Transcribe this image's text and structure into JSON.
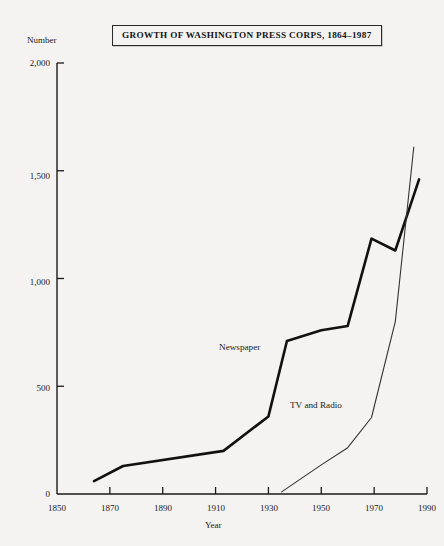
{
  "title": {
    "text": "GROWTH OF WASHINGTON PRESS CORPS, 1864–1987"
  },
  "axes": {
    "y_caption": "Number",
    "x_caption": "Year",
    "y_ticks": [
      "2,000",
      "1,500",
      "1,000",
      "500",
      "0"
    ],
    "x_ticks": [
      "1850",
      "1870",
      "1890",
      "1910",
      "1930",
      "1950",
      "1970",
      "1990"
    ]
  },
  "labels": {
    "newspaper": "Newspaper",
    "tv_and_radio": "TV and Radio"
  },
  "colors": {
    "background": "#f4f3f1",
    "ink": "#1a1a1a",
    "newspaper_line": "#111111",
    "tvradio_line": "#333333"
  },
  "chart_data": {
    "type": "line",
    "title": "GROWTH OF WASHINGTON PRESS CORPS, 1864–1987",
    "xlabel": "Year",
    "ylabel": "Number",
    "xlim": [
      1850,
      1990
    ],
    "ylim": [
      0,
      2000
    ],
    "xticks": [
      1850,
      1870,
      1890,
      1910,
      1930,
      1950,
      1970,
      1990
    ],
    "yticks": [
      0,
      500,
      1000,
      1500,
      2000
    ],
    "grid": false,
    "legend": "inline-labels",
    "series": [
      {
        "name": "Newspaper",
        "style": "thick",
        "x": [
          1864,
          1875,
          1913,
          1930,
          1937,
          1950,
          1960,
          1969,
          1978,
          1987
        ],
        "values": [
          60,
          130,
          200,
          360,
          710,
          760,
          780,
          1185,
          1130,
          1460
        ]
      },
      {
        "name": "TV and Radio",
        "style": "thin",
        "x": [
          1935,
          1950,
          1960,
          1969,
          1978,
          1985
        ],
        "values": [
          10,
          135,
          215,
          355,
          800,
          1610
        ]
      }
    ]
  }
}
